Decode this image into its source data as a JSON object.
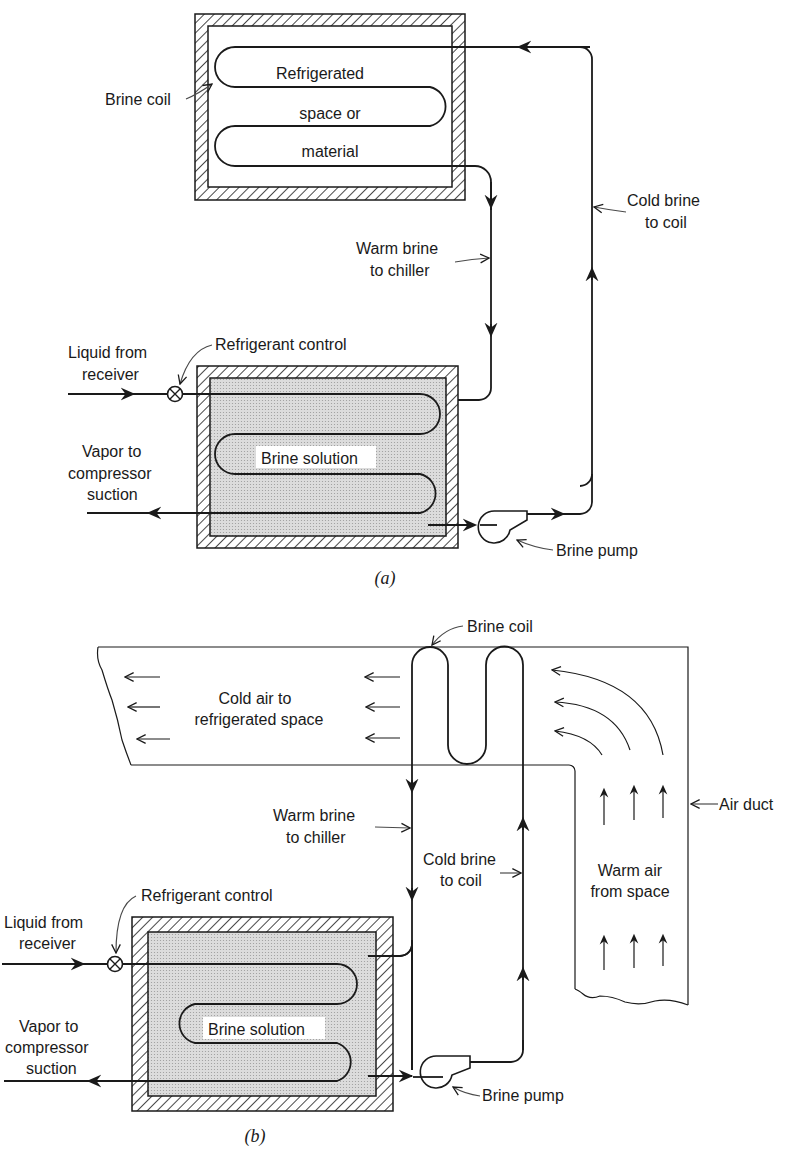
{
  "figure": {
    "part_a": {
      "caption": "(a)",
      "space_box": {
        "label_line1": "Refrigerated",
        "label_line2": "space or",
        "label_line3": "material"
      },
      "brine_coil_label": "Brine coil",
      "warm_brine_label_line1": "Warm brine",
      "warm_brine_label_line2": "to chiller",
      "cold_brine_label_line1": "Cold brine",
      "cold_brine_label_line2": "to coil",
      "liquid_label_line1": "Liquid from",
      "liquid_label_line2": "receiver",
      "refrigerant_control_label": "Refrigerant control",
      "vapor_label_line1": "Vapor to",
      "vapor_label_line2": "compressor",
      "vapor_label_line3": "suction",
      "brine_solution_label": "Brine solution",
      "brine_pump_label": "Brine pump"
    },
    "part_b": {
      "caption": "(b)",
      "brine_coil_label": "Brine coil",
      "cold_air_label_line1": "Cold air to",
      "cold_air_label_line2": "refrigerated space",
      "air_duct_label": "Air duct",
      "warm_brine_label_line1": "Warm brine",
      "warm_brine_label_line2": "to chiller",
      "cold_brine_label_line1": "Cold brine",
      "cold_brine_label_line2": "to coil",
      "warm_air_label_line1": "Warm air",
      "warm_air_label_line2": "from space",
      "refrigerant_control_label": "Refrigerant control",
      "liquid_label_line1": "Liquid from",
      "liquid_label_line2": "receiver",
      "vapor_label_line1": "Vapor to",
      "vapor_label_line2": "compressor",
      "vapor_label_line3": "suction",
      "brine_solution_label": "Brine solution",
      "brine_pump_label": "Brine pump"
    },
    "colors": {
      "ink": "#1a1a1a",
      "brine_fill": "#d9d9d9",
      "background": "#ffffff"
    }
  }
}
